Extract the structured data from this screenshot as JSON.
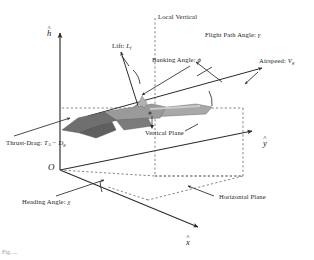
{
  "figure": {
    "background_color": "#ffffff",
    "line_color": "#2b2b2b",
    "dashed_color": "#6e6e6e",
    "aircraft_fill": "#8c8c8c",
    "aircraft_shadow": "#5e5e5e",
    "aircraft_light": "#c9c9c9"
  },
  "axes": {
    "h": {
      "label": "h",
      "accent": "^",
      "description": "vertical-altitude-axis"
    },
    "y": {
      "label": "y",
      "accent": "^",
      "description": "lateral-axis"
    },
    "x": {
      "label": "x",
      "accent": "^",
      "description": "longitudinal-axis"
    },
    "origin": {
      "label": "O"
    }
  },
  "labels": {
    "local_vertical": "Local Vertical",
    "lift": {
      "text": "Lift: ",
      "symbol": "L",
      "subscript": "f"
    },
    "banking_angle": {
      "text": "Banking Angle: ",
      "symbol": "ϕ"
    },
    "flight_path_angle": {
      "text": "Flight Path Angle: ",
      "symbol": "γ"
    },
    "airspeed": {
      "text": "Airspeed: ",
      "symbol": "V",
      "subscript": "g"
    },
    "thrust_drag": {
      "text": "Thrust-Drag: ",
      "symbol1": "T",
      "sub1": "A",
      "operator": " − ",
      "symbol2": "D",
      "sub2": "g"
    },
    "vertical_plane": "Vertical Plane",
    "horizontal_plane": "Horizontal Plane",
    "heading_angle": {
      "text": "Heading Angle: ",
      "symbol": "χ"
    }
  },
  "caption": "Fig. ..."
}
